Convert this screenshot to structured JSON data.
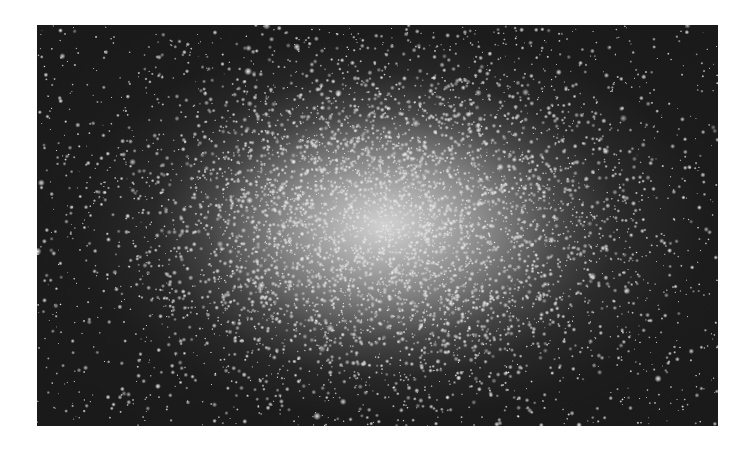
{
  "image": {
    "subject": "globular star cluster",
    "rendering": "grayscale astrophotograph",
    "frame": {
      "x": 37,
      "y": 25,
      "width": 681,
      "height": 401
    },
    "colors": {
      "border": "#ffffff",
      "sky": "#1a1a1a",
      "core": "#e6e6e6",
      "star": "#f2f2f2"
    },
    "cluster_center": {
      "x_frac": 0.51,
      "y_frac": 0.5
    },
    "starfield": {
      "seed": 1337,
      "field_stars": 1400,
      "cluster_stars": 5200,
      "cluster_sigma_x": 0.2,
      "cluster_sigma_y": 0.24
    }
  }
}
